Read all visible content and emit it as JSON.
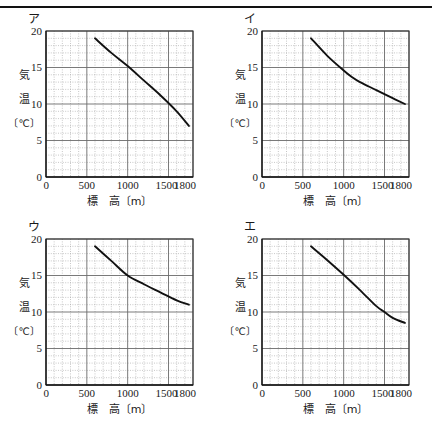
{
  "figure": {
    "panel_count": 4,
    "axis": {
      "x_label": "標　高〔m〕",
      "y_label_line1": "気",
      "y_label_line2": "温",
      "y_label_line3": "〔℃〕",
      "x_ticks": [
        "0",
        "500",
        "1000",
        "1500",
        "1800"
      ],
      "y_ticks": [
        "0",
        "5",
        "10",
        "15",
        "20"
      ]
    },
    "colors": {
      "line": "#111111",
      "major_grid": "#6b6b6b",
      "minor_grid": "#9a9a9a",
      "frame": "#333333",
      "background": "#ffffff"
    }
  },
  "panels": [
    {
      "label": "ア",
      "name": "panel-a"
    },
    {
      "label": "イ",
      "name": "panel-b"
    },
    {
      "label": "ウ",
      "name": "panel-c"
    },
    {
      "label": "エ",
      "name": "panel-d"
    }
  ],
  "chart_data": [
    {
      "type": "line",
      "title": "ア",
      "xlabel": "標　高〔m〕",
      "ylabel": "気温〔℃〕",
      "xlim": [
        0,
        1800
      ],
      "ylim": [
        0,
        20
      ],
      "xticks": [
        0,
        500,
        1000,
        1500,
        1800
      ],
      "yticks": [
        0,
        5,
        10,
        15,
        20
      ],
      "x_minor_step": 100,
      "y_minor_step": 1,
      "grid": true,
      "legend": "none",
      "series": [
        {
          "name": "気温",
          "x": [
            600,
            800,
            1000,
            1200,
            1400,
            1600,
            1750
          ],
          "values": [
            19.0,
            17.0,
            15.2,
            13.2,
            11.2,
            9.0,
            7.0
          ]
        }
      ]
    },
    {
      "type": "line",
      "title": "イ",
      "xlabel": "標　高〔m〕",
      "ylabel": "気温〔℃〕",
      "xlim": [
        0,
        1800
      ],
      "ylim": [
        0,
        20
      ],
      "xticks": [
        0,
        500,
        1000,
        1500,
        1800
      ],
      "yticks": [
        0,
        5,
        10,
        15,
        20
      ],
      "x_minor_step": 100,
      "y_minor_step": 1,
      "grid": true,
      "legend": "none",
      "series": [
        {
          "name": "気温",
          "x": [
            600,
            800,
            1000,
            1100,
            1200,
            1400,
            1600,
            1750
          ],
          "values": [
            19.0,
            16.6,
            14.6,
            13.7,
            13.0,
            11.9,
            10.8,
            10.0
          ]
        }
      ]
    },
    {
      "type": "line",
      "title": "ウ",
      "xlabel": "標　高〔m〕",
      "ylabel": "気温〔℃〕",
      "xlim": [
        0,
        1800
      ],
      "ylim": [
        0,
        20
      ],
      "xticks": [
        0,
        500,
        1000,
        1500,
        1800
      ],
      "yticks": [
        0,
        5,
        10,
        15,
        20
      ],
      "x_minor_step": 100,
      "y_minor_step": 1,
      "grid": true,
      "legend": "none",
      "series": [
        {
          "name": "気温",
          "x": [
            600,
            800,
            1000,
            1200,
            1400,
            1600,
            1750
          ],
          "values": [
            19.0,
            17.0,
            15.0,
            13.8,
            12.7,
            11.6,
            11.0
          ]
        }
      ]
    },
    {
      "type": "line",
      "title": "エ",
      "xlabel": "標　高〔m〕",
      "ylabel": "気温〔℃〕",
      "xlim": [
        0,
        1800
      ],
      "ylim": [
        0,
        20
      ],
      "xticks": [
        0,
        500,
        1000,
        1500,
        1800
      ],
      "yticks": [
        0,
        5,
        10,
        15,
        20
      ],
      "x_minor_step": 100,
      "y_minor_step": 1,
      "grid": true,
      "legend": "none",
      "series": [
        {
          "name": "気温",
          "x": [
            600,
            800,
            1000,
            1200,
            1400,
            1500,
            1600,
            1750
          ],
          "values": [
            19.0,
            17.1,
            15.1,
            13.0,
            10.8,
            10.0,
            9.2,
            8.5
          ]
        }
      ]
    }
  ]
}
